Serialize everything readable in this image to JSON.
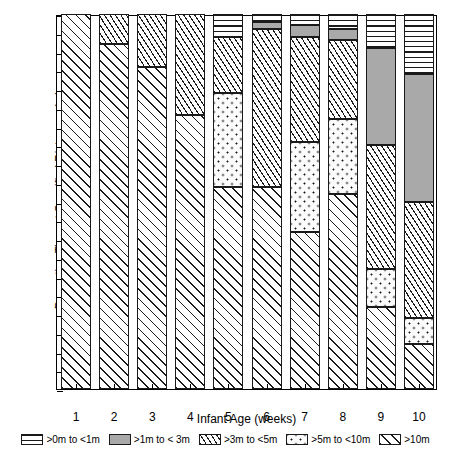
{
  "chart_data": {
    "type": "bar",
    "subtype": "stacked-bar-100-percent",
    "title": "",
    "xlabel": "Infant Age (weeks)",
    "ylabel": "Proportion Time at Specified Distances (m)",
    "categories": [
      "1",
      "2",
      "3",
      "4",
      "5",
      "6",
      "7",
      "8",
      "9",
      "10"
    ],
    "ylim": [
      0,
      100
    ],
    "ytick_major": [
      0,
      10,
      20,
      30,
      40,
      50,
      60,
      70,
      80,
      90,
      100
    ],
    "ytick_minor": [
      5,
      15,
      25,
      35,
      45,
      55,
      65,
      75,
      85,
      95
    ],
    "grid": false,
    "legend_position": "bottom",
    "series": [
      {
        "name": ">0m to <1m",
        "pattern": "horizontal-lines",
        "values": [
          0,
          0,
          0,
          0,
          6,
          2,
          3,
          4,
          9,
          16
        ]
      },
      {
        "name": ">1m to < 3m",
        "pattern": "solid-gray",
        "values": [
          0,
          0,
          0,
          0,
          0,
          2,
          3,
          3,
          26,
          34
        ]
      },
      {
        "name": ">3m to <5m",
        "pattern": "steep-hatch",
        "values": [
          0,
          8,
          14,
          27,
          15,
          42,
          28,
          21,
          33,
          31
        ]
      },
      {
        "name": ">5m to <10m",
        "pattern": "dots",
        "values": [
          0,
          0,
          0,
          0,
          25,
          0,
          24,
          20,
          10,
          7
        ]
      },
      {
        "name": ">10m",
        "pattern": "wide-hatch",
        "values": [
          100,
          92,
          86,
          73,
          54,
          54,
          42,
          52,
          22,
          12
        ]
      }
    ],
    "stack_order_bottom_to_top": [
      ">10m",
      ">5m to <10m",
      ">3m to <5m",
      ">1m to < 3m",
      ">0m to <1m"
    ],
    "cumulative_tops": {
      "1": {
        ">10m": 100,
        ">5m to <10m": 100,
        ">3m to <5m": 100,
        ">1m to < 3m": 100,
        ">0m to <1m": 100
      },
      "2": {
        ">10m": 92,
        ">5m to <10m": 92,
        ">3m to <5m": 100,
        ">1m to < 3m": 100,
        ">0m to <1m": 100
      },
      "3": {
        ">10m": 86,
        ">5m to <10m": 86,
        ">3m to <5m": 100,
        ">1m to < 3m": 100,
        ">0m to <1m": 100
      },
      "4": {
        ">10m": 73,
        ">5m to <10m": 73,
        ">3m to <5m": 100,
        ">1m to < 3m": 100,
        ">0m to <1m": 100
      },
      "5": {
        ">10m": 54,
        ">5m to <10m": 79,
        ">3m to <5m": 94,
        ">1m to < 3m": 94,
        ">0m to <1m": 100
      },
      "6": {
        ">10m": 54,
        ">5m to <10m": 54,
        ">3m to <5m": 96,
        ">1m to < 3m": 98,
        ">0m to <1m": 100
      },
      "7": {
        ">10m": 42,
        ">5m to <10m": 66,
        ">3m to <5m": 94,
        ">1m to < 3m": 97,
        ">0m to <1m": 100
      },
      "8": {
        ">10m": 52,
        ">5m to <10m": 72,
        ">3m to <5m": 93,
        ">1m to < 3m": 96,
        ">0m to <1m": 100
      },
      "9": {
        ">10m": 22,
        ">5m to <10m": 32,
        ">3m to <5m": 65,
        ">1m to < 3m": 91,
        ">0m to <1m": 100
      },
      "10": {
        ">10m": 12,
        ">5m to <10m": 19,
        ">3m to <5m": 50,
        ">1m to < 3m": 84,
        ">0m to <1m": 100
      }
    }
  },
  "legend": {
    "items": [
      {
        "label": ">0m to <1m",
        "pattern": "horizontal-lines"
      },
      {
        "label": ">1m to < 3m",
        "pattern": "solid-gray"
      },
      {
        "label": ">3m to <5m",
        "pattern": "steep-hatch"
      },
      {
        "label": ">5m to <10m",
        "pattern": "dots"
      },
      {
        "label": ">10m",
        "pattern": "wide-hatch"
      }
    ]
  }
}
